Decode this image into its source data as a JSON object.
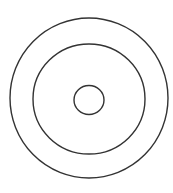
{
  "diagram": {
    "type": "concentric-circles-sketch",
    "background": "#ffffff",
    "stroke_color": "#333333",
    "stroke_width": 1.4,
    "circles": [
      {
        "name": "outer-circle",
        "cx": 89,
        "cy": 98,
        "rx": 79,
        "ry": 80
      },
      {
        "name": "middle-circle",
        "cx": 89,
        "cy": 99,
        "rx": 56,
        "ry": 55
      },
      {
        "name": "inner-circle",
        "cx": 89,
        "cy": 100,
        "rx": 15,
        "ry": 14.5
      }
    ]
  }
}
